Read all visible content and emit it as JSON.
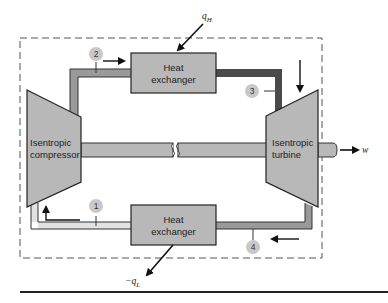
{
  "diagram": {
    "components": {
      "compressor": {
        "line1": "Isentropic",
        "line2": "compressor"
      },
      "turbine": {
        "line1": "Isentropic",
        "line2": "turbine"
      },
      "heat_exchanger_top": {
        "line1": "Heat",
        "line2": "exchanger"
      },
      "heat_exchanger_bottom": {
        "line1": "Heat",
        "line2": "exchanger"
      }
    },
    "states": [
      "1",
      "2",
      "3",
      "4"
    ],
    "energy_labels": {
      "heat_in": "q",
      "heat_in_sub": "H",
      "heat_out_prefix": "−q",
      "heat_out_sub": "L",
      "work_out": "w"
    },
    "colors": {
      "component_fill": "#b8b8b8",
      "pipe_state1": "#e2e2e2",
      "pipe_state2": "#9a9a9a",
      "pipe_state3": "#4a4a4a",
      "pipe_state4": "#9a9a9a",
      "state_circle": "#c8c8c8",
      "outline": "#222222"
    }
  }
}
